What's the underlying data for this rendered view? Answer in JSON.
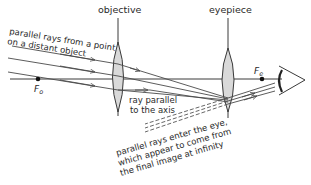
{
  "diagram": {
    "labels": {
      "objective": "objective",
      "eyepiece": "eyepiece",
      "incoming_rays_line1": "parallel rays from a point",
      "incoming_rays_line2": "on a distant object",
      "focus_objective": "F",
      "focus_objective_sub": "o",
      "focus_eyepiece": "F",
      "focus_eyepiece_sub": "e",
      "axis_ray_line1": "ray parallel",
      "axis_ray_line2": "to the axis",
      "exit_rays_line1": "parallel rays enter the eye,",
      "exit_rays_line2": "which appear to come from",
      "exit_rays_line3": "the final image at infinity"
    },
    "colors": {
      "line": "#3a3a3a",
      "lens_fill": "#d9d9d9",
      "dashed": "#555555"
    }
  }
}
